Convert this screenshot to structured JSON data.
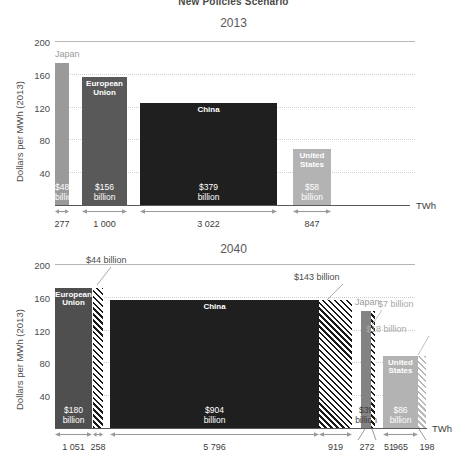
{
  "supertitle": "New Policies Scenario",
  "axis": {
    "ylabel": "Dollars per MWh (2013)",
    "xunit": "TWh",
    "yticks": [
      "200",
      "160",
      "120",
      "80",
      "40"
    ],
    "ymin": 0,
    "ymax": 200
  },
  "panels": [
    {
      "id": "2013",
      "title": "2013",
      "bars": [
        {
          "name": "Japan",
          "value_label": "$48\nbillion",
          "price": 173,
          "twh": 277,
          "twh_label": "277",
          "color": "#9a9a9a",
          "label_outside": true,
          "label_color": "#9a9a9a"
        },
        {
          "name": "European\nUnion",
          "value_label": "$156\nbillion",
          "price": 156,
          "twh": 1000,
          "twh_label": "1 000",
          "color": "#595959",
          "label_outside": false
        },
        {
          "name": "China",
          "value_label": "$379\nbillion",
          "price": 125,
          "twh": 3022,
          "twh_label": "3 022",
          "color": "#1f1f1f",
          "label_outside": false
        },
        {
          "name": "United\nStates",
          "value_label": "$58\nbillion",
          "price": 68,
          "twh": 847,
          "twh_label": "847",
          "color": "#b3b3b3",
          "label_outside": false
        }
      ]
    },
    {
      "id": "2040",
      "title": "2040",
      "bars": [
        {
          "name": "European\nUnion",
          "value_label": "$180\nbillion",
          "price": 171,
          "twh": 1051,
          "twh_label": "1 051",
          "color": "#4f4f4f",
          "label_outside": false
        },
        {
          "name": "",
          "value_label": "",
          "price": 171,
          "twh": 258,
          "twh_label": "258",
          "hatch": "dark",
          "callout": "$44 billion"
        },
        {
          "name": "China",
          "value_label": "$904\nbillion",
          "price": 156,
          "twh": 5796,
          "twh_label": "5 796",
          "color": "#1f1f1f",
          "label_outside": false
        },
        {
          "name": "",
          "value_label": "",
          "price": 156,
          "twh": 919,
          "twh_label": "919",
          "hatch": "dark",
          "callout": "$143 billion"
        },
        {
          "name": "Japan",
          "value_label": "$39\nbillion",
          "price": 143,
          "twh": 272,
          "twh_label": "272",
          "color": "#838383",
          "label_outside": true,
          "label_color": "#9a9a9a"
        },
        {
          "name": "",
          "value_label": "",
          "price": 143,
          "twh": 51,
          "twh_label": "51",
          "hatch": "dark",
          "callout": "$7 billion"
        },
        {
          "name": "United\nStates",
          "value_label": "$86\nbillion",
          "price": 88,
          "twh": 965,
          "twh_label": "965",
          "color": "#b3b3b3",
          "label_outside": false
        },
        {
          "name": "",
          "value_label": "",
          "price": 88,
          "twh": 198,
          "twh_label": "198",
          "hatch": "light",
          "callout": "$18 billion"
        }
      ]
    }
  ],
  "chart_data": {
    "type": "bar",
    "title": "New Policies Scenario",
    "subtitles": [
      "2013",
      "2040"
    ],
    "ylabel": "Dollars per MWh (2013)",
    "xlabel": "TWh",
    "ylim": [
      0,
      200
    ],
    "yticks": [
      40,
      80,
      120,
      160,
      200
    ],
    "grid": true,
    "legend": "none",
    "note": "Bar width encodes electricity demand in TWh; bar height encodes average price in dollars per MWh (2013); area = total bill. Hatched blocks are additional demand/spending.",
    "panels": [
      {
        "year": 2013,
        "series": [
          {
            "name": "Japan",
            "price_usd_per_mwh": 173,
            "demand_twh": 277,
            "spend_billion_usd": 48,
            "spend_label": "$48 billion",
            "color": "#9a9a9a"
          },
          {
            "name": "European Union",
            "price_usd_per_mwh": 156,
            "demand_twh": 1000,
            "spend_billion_usd": 156,
            "spend_label": "$156 billion",
            "color": "#595959"
          },
          {
            "name": "China",
            "price_usd_per_mwh": 125,
            "demand_twh": 3022,
            "spend_billion_usd": 379,
            "spend_label": "$379 billion",
            "color": "#1f1f1f"
          },
          {
            "name": "United States",
            "price_usd_per_mwh": 68,
            "demand_twh": 847,
            "spend_billion_usd": 58,
            "spend_label": "$58 billion",
            "color": "#b3b3b3"
          }
        ]
      },
      {
        "year": 2040,
        "series": [
          {
            "name": "European Union",
            "price_usd_per_mwh": 171,
            "demand_twh": 1051,
            "spend_billion_usd": 180,
            "spend_label": "$180 billion",
            "color": "#4f4f4f",
            "additional": {
              "demand_twh": 258,
              "spend_billion_usd": 44,
              "spend_label": "$44 billion",
              "pattern": "hatched"
            }
          },
          {
            "name": "China",
            "price_usd_per_mwh": 156,
            "demand_twh": 5796,
            "spend_billion_usd": 904,
            "spend_label": "$904 billion",
            "color": "#1f1f1f",
            "additional": {
              "demand_twh": 919,
              "spend_billion_usd": 143,
              "spend_label": "$143 billion",
              "pattern": "hatched"
            }
          },
          {
            "name": "Japan",
            "price_usd_per_mwh": 143,
            "demand_twh": 272,
            "spend_billion_usd": 39,
            "spend_label": "$39 billion",
            "color": "#838383",
            "additional": {
              "demand_twh": 51,
              "spend_billion_usd": 7,
              "spend_label": "$7 billion",
              "pattern": "hatched"
            }
          },
          {
            "name": "United States",
            "price_usd_per_mwh": 88,
            "demand_twh": 965,
            "spend_billion_usd": 86,
            "spend_label": "$86 billion",
            "color": "#b3b3b3",
            "additional": {
              "demand_twh": 198,
              "spend_billion_usd": 18,
              "spend_label": "$18 billion",
              "pattern": "hatched-light"
            }
          }
        ]
      }
    ]
  }
}
